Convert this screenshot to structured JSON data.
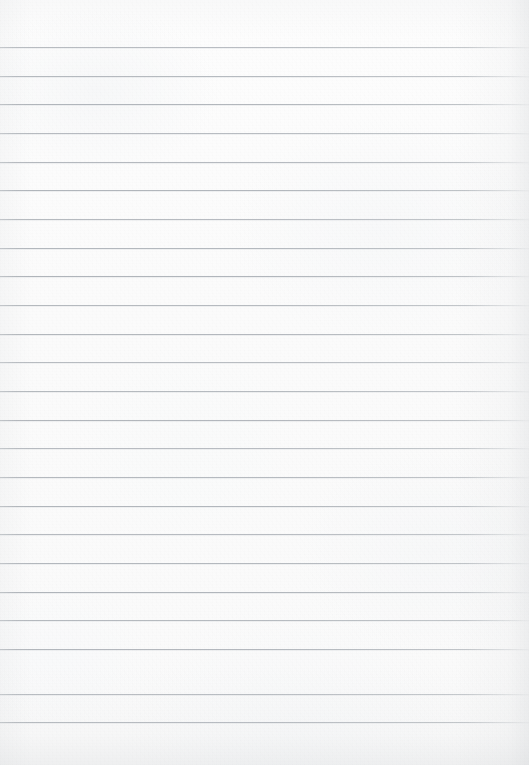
{
  "document": {
    "kind": "scanned-ruled-paper",
    "title": "Blank ruled notebook paper",
    "page_width": 529,
    "page_height": 765,
    "orientation": "portrait",
    "content_text": "",
    "has_handwriting": false,
    "has_printed_text": false
  },
  "paper": {
    "background_color": "#fcfcfc",
    "tint_color": "#fafafa",
    "texture": "subtle mottled fibre grain",
    "vignette_color": "#cdd0d3",
    "vignette_edges": "right, bottom"
  },
  "ruling": {
    "style": "horizontal feint rules",
    "line_color": "#acb1b7",
    "line_thickness_px": 1,
    "line_spacing_px": 28.7,
    "first_line_y": 47,
    "last_line_y": 722,
    "left_inset_px": 0,
    "right_inset_px": 0,
    "top_margin_px": 47,
    "bottom_margin_px": 43,
    "has_vertical_margin_rule": false,
    "line_count": 24,
    "line_positions": [
      47,
      76,
      104,
      133,
      162,
      190,
      219,
      248,
      276,
      305,
      334,
      362,
      391,
      420,
      448,
      477,
      506,
      534,
      563,
      592,
      620,
      649,
      694,
      722
    ]
  }
}
